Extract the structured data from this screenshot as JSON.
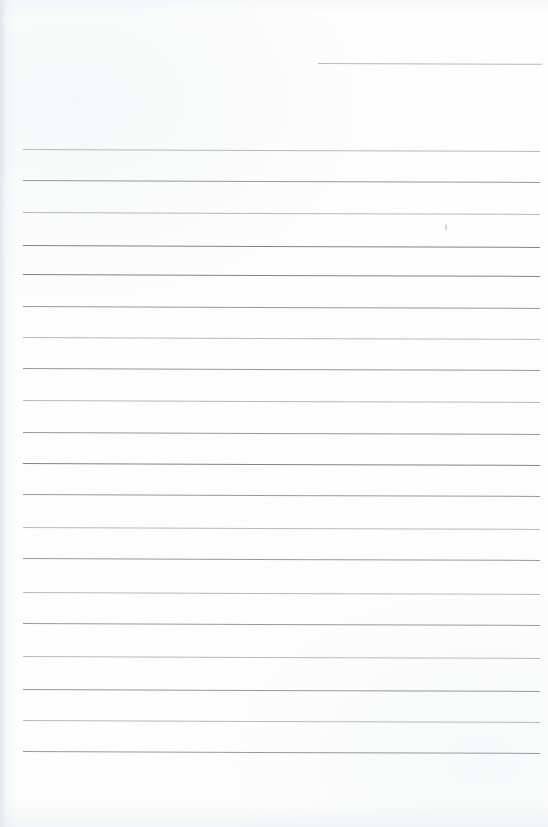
{
  "document": {
    "kind": "scanned-lined-paper",
    "title": "Blank ruled notebook page",
    "description": "Scanned sheet of blank lined writing paper, no handwriting or printed text present",
    "width_px": 548,
    "height_px": 827,
    "paper_color": "#fdfdfd",
    "rule_color": "#8f9094",
    "rule_color_light": "#a6a7ab",
    "rule_color_dark": "#7d7e83",
    "edge_shadow_color": "#e1e2e5",
    "scan_tilt_deg": 0.22,
    "rule_count": 20,
    "text_content": ""
  },
  "rules": [
    {
      "id": "rule-00",
      "x": 318,
      "y": 63,
      "width": 224,
      "weight": "light",
      "note": "short header rule, right aligned"
    },
    {
      "id": "rule-01",
      "x": 23,
      "y": 149,
      "width": 517,
      "weight": "light"
    },
    {
      "id": "rule-02",
      "x": 23,
      "y": 180,
      "width": 517,
      "weight": "normal"
    },
    {
      "id": "rule-03",
      "x": 23,
      "y": 212,
      "width": 517,
      "weight": "light"
    },
    {
      "id": "rule-04",
      "x": 23,
      "y": 245,
      "width": 517,
      "weight": "dark"
    },
    {
      "id": "rule-05",
      "x": 23,
      "y": 274,
      "width": 517,
      "weight": "dark"
    },
    {
      "id": "rule-06",
      "x": 23,
      "y": 306,
      "width": 517,
      "weight": "normal"
    },
    {
      "id": "rule-07",
      "x": 23,
      "y": 337,
      "width": 517,
      "weight": "light"
    },
    {
      "id": "rule-08",
      "x": 23,
      "y": 368,
      "width": 517,
      "weight": "normal"
    },
    {
      "id": "rule-09",
      "x": 23,
      "y": 400,
      "width": 517,
      "weight": "light"
    },
    {
      "id": "rule-10",
      "x": 23,
      "y": 432,
      "width": 517,
      "weight": "normal"
    },
    {
      "id": "rule-11",
      "x": 23,
      "y": 463,
      "width": 517,
      "weight": "dark"
    },
    {
      "id": "rule-12",
      "x": 23,
      "y": 494,
      "width": 517,
      "weight": "normal"
    },
    {
      "id": "rule-13",
      "x": 23,
      "y": 527,
      "width": 517,
      "weight": "light"
    },
    {
      "id": "rule-14",
      "x": 23,
      "y": 558,
      "width": 517,
      "weight": "normal"
    },
    {
      "id": "rule-15",
      "x": 23,
      "y": 592,
      "width": 517,
      "weight": "light"
    },
    {
      "id": "rule-16",
      "x": 23,
      "y": 623,
      "width": 517,
      "weight": "normal"
    },
    {
      "id": "rule-17",
      "x": 23,
      "y": 656,
      "width": 517,
      "weight": "light"
    },
    {
      "id": "rule-18",
      "x": 23,
      "y": 689,
      "width": 517,
      "weight": "normal"
    },
    {
      "id": "rule-19",
      "x": 23,
      "y": 720,
      "width": 517,
      "weight": "light"
    },
    {
      "id": "rule-20",
      "x": 23,
      "y": 751,
      "width": 517,
      "weight": "normal"
    }
  ],
  "marks": [
    {
      "id": "stray-mark",
      "x": 445,
      "y": 224,
      "description": "faint pencil tick beneath the third full rule"
    }
  ]
}
